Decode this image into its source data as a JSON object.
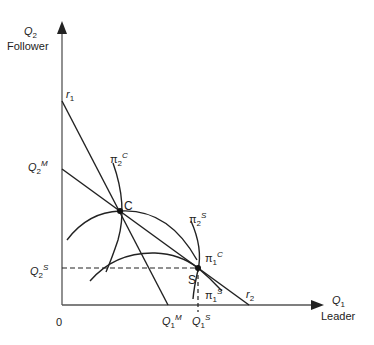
{
  "axes": {
    "y": {
      "symbol": "Q",
      "sub": "2",
      "caption": "Follower"
    },
    "x": {
      "symbol": "Q",
      "sub": "1",
      "caption": "Leader"
    },
    "origin": "0"
  },
  "lines": {
    "r1": {
      "symbol": "r",
      "sub": "1"
    },
    "r2": {
      "symbol": "r",
      "sub": "2"
    }
  },
  "points": {
    "C": "C",
    "S": "S"
  },
  "ticks": {
    "q2m": {
      "symbol": "Q",
      "sub": "2",
      "sup": "M"
    },
    "q2s": {
      "symbol": "Q",
      "sub": "2",
      "sup": "S"
    },
    "q1m": {
      "symbol": "Q",
      "sub": "1",
      "sup": "M"
    },
    "q1s": {
      "symbol": "Q",
      "sub": "1",
      "sup": "S"
    }
  },
  "isoprofit": {
    "pi2c": {
      "symbol": "π",
      "sub": "2",
      "sup": "C"
    },
    "pi2s": {
      "symbol": "π",
      "sub": "2",
      "sup": "S"
    },
    "pi1c": {
      "symbol": "π",
      "sub": "1",
      "sup": "C"
    },
    "pi1s": {
      "symbol": "π",
      "sub": "1",
      "sup": "S"
    }
  },
  "colors": {
    "line": "#222222",
    "axis": "#555555"
  }
}
